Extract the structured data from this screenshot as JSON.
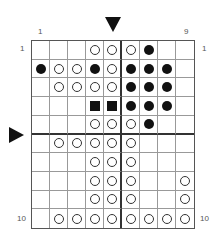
{
  "labels": {
    "col_first": "1",
    "col_last": "9",
    "row_first_left": "1",
    "row_first_right": "1",
    "row_last_left": "10",
    "row_last_right": "10"
  },
  "markers": {
    "top_arrow_column": 5,
    "left_arrow_between_rows": [
      5,
      6
    ]
  },
  "board": {
    "columns": 9,
    "rows": 10,
    "legend": {
      "O": "white-stone",
      "B": "black-stone",
      "S": "black-square",
      "_": "empty"
    },
    "cells": [
      [
        "_",
        "_",
        "_",
        "O",
        "O",
        "O",
        "B",
        "_",
        "_"
      ],
      [
        "B",
        "O",
        "O",
        "B",
        "O",
        "B",
        "B",
        "B",
        "_"
      ],
      [
        "_",
        "O",
        "O",
        "O",
        "O",
        "B",
        "B",
        "B",
        "_"
      ],
      [
        "_",
        "_",
        "_",
        "S",
        "S",
        "B",
        "B",
        "B",
        "_"
      ],
      [
        "_",
        "_",
        "_",
        "O",
        "O",
        "O",
        "B",
        "_",
        "_"
      ],
      [
        "_",
        "O",
        "O",
        "O",
        "O",
        "O",
        "_",
        "_",
        "_"
      ],
      [
        "_",
        "_",
        "_",
        "O",
        "O",
        "O",
        "_",
        "_",
        "_"
      ],
      [
        "_",
        "_",
        "_",
        "O",
        "O",
        "O",
        "_",
        "_",
        "O"
      ],
      [
        "_",
        "_",
        "_",
        "O",
        "O",
        "O",
        "_",
        "_",
        "O"
      ],
      [
        "_",
        "O",
        "O",
        "O",
        "O",
        "O",
        "O",
        "O",
        "O"
      ]
    ]
  }
}
